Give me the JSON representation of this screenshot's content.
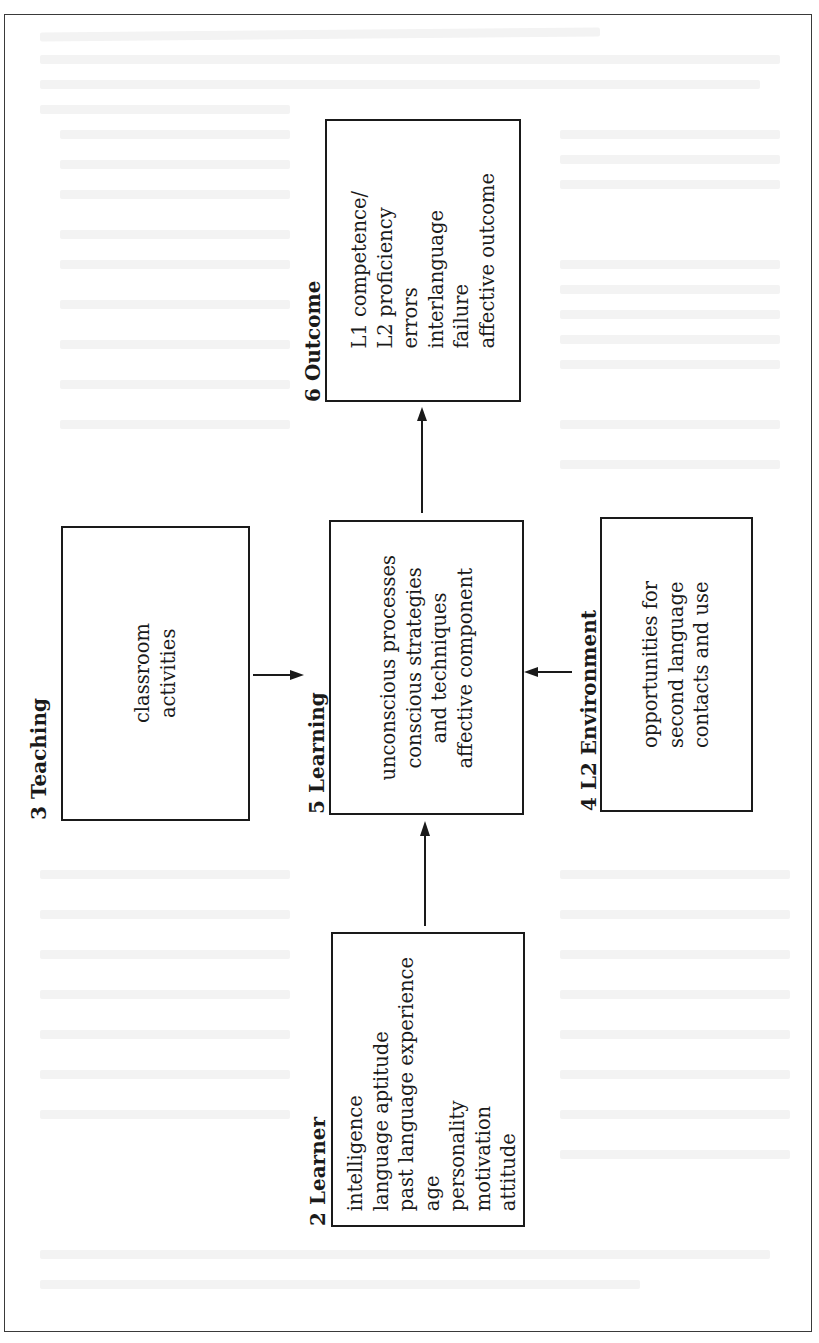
{
  "figure": {
    "orientation": "rotated-90-counterclockwise",
    "components": {
      "learner": {
        "number": "2",
        "label": "2 Learner",
        "items": [
          "intelligence",
          "language aptitude",
          "past language experience",
          "age",
          "personality",
          "motivation",
          "attitude"
        ]
      },
      "teaching": {
        "number": "3",
        "label": "3 Teaching",
        "items": [
          "classroom",
          "activities"
        ]
      },
      "environment": {
        "number": "4",
        "label": "4 L2 Environment",
        "items": [
          "opportunities for",
          "second language",
          "contacts and use"
        ]
      },
      "learning": {
        "number": "5",
        "label": "5 Learning",
        "items": [
          "unconscious processes",
          "conscious strategies",
          "and techniques",
          "affective component"
        ]
      },
      "outcome": {
        "number": "6",
        "label": "6 Outcome",
        "items": [
          "L1 competence/",
          "L2 proficiency",
          "errors",
          "interlanguage",
          "failure",
          "affective outcome"
        ]
      }
    },
    "arrows": [
      {
        "from": "2 Learner",
        "to": "5 Learning"
      },
      {
        "from": "3 Teaching",
        "to": "5 Learning"
      },
      {
        "from": "4 L2 Environment",
        "to": "5 Learning"
      },
      {
        "from": "5 Learning",
        "to": "6 Outcome"
      }
    ],
    "colors": {
      "ink": "#1a1a1a",
      "paper": "#ffffff"
    }
  }
}
